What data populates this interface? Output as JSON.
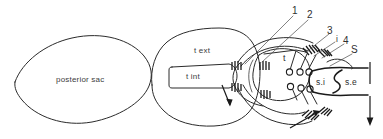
{
  "figure": {
    "background_color": "#ffffff",
    "line_color": "#2b2b2b",
    "text_color": "#3d3d3d",
    "width": 383,
    "height": 139
  },
  "labels": {
    "posterior_sac": "posterior sac",
    "t_ext": "t ext",
    "t_int": "t int",
    "t": "t",
    "num_1": "1",
    "num_2": "2",
    "num_3": "3",
    "letter_i": "i",
    "num_4": "4",
    "letter_s": "S",
    "siphon_internal": "s.i",
    "siphon_external": "s.e"
  },
  "icons": {
    "arrow_down_inner": "arrow-down-icon",
    "arrow_up_right": "arrow-up-right-icon",
    "arrow_down_right_margin": "arrow-down-icon"
  }
}
